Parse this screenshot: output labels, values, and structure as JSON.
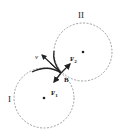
{
  "diagram": {
    "circle_I": {
      "label": "I",
      "cx": 44,
      "cy": 98,
      "r": 30,
      "style": "dashed"
    },
    "circle_II": {
      "label": "II",
      "cx": 83,
      "cy": 52,
      "r": 29,
      "style": "dashed"
    },
    "point_B": {
      "label": "B"
    },
    "force_F1": {
      "label": "F",
      "subscript": "1"
    },
    "force_F2": {
      "label": "F",
      "subscript": "2"
    },
    "velocity": {
      "label": "v"
    },
    "colors": {
      "line": "#222222",
      "dash": "#888888"
    }
  }
}
